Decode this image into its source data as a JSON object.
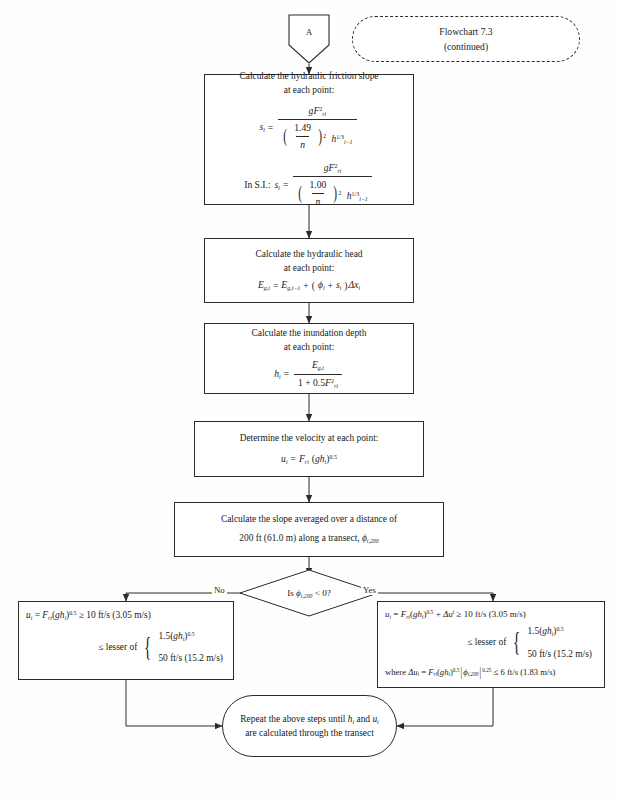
{
  "page": {
    "title_box": {
      "line1": "Flowchart 7.3",
      "line2": "(continued)"
    },
    "connector_in": {
      "label": "A",
      "icon": "pentagon-connector-icon"
    }
  },
  "nodes": {
    "friction_slope": {
      "name": "calculate-friction-slope",
      "line1": "Calculate the hydraulic friction slope",
      "line2": "at each point:",
      "eq_us": {
        "lhs": "s",
        "lhs_sub": "i",
        "eq": "=",
        "num_g": "g",
        "num_F": "F",
        "num_F_sub": "ri",
        "num_F_sup": "2",
        "den_frac_top": "1.49",
        "den_frac_bot": "n",
        "den_paren_sup": "2",
        "den_h": "h",
        "den_h_sub": "i−1",
        "den_h_sup": "1/3"
      },
      "si_prefix": "In S.I.:",
      "eq_si": {
        "lhs": "s",
        "lhs_sub": "i",
        "eq": "=",
        "num_g": "g",
        "num_F": "F",
        "num_F_sub": "ri",
        "num_F_sup": "2",
        "den_frac_top": "1.00",
        "den_frac_bot": "n",
        "den_paren_sup": "2",
        "den_h": "h",
        "den_h_sub": "i−1",
        "den_h_sup": "1/3"
      }
    },
    "hydraulic_head": {
      "name": "calculate-hydraulic-head",
      "line1": "Calculate the hydraulic head",
      "line2": "at each point:",
      "eq": {
        "lhs": "E",
        "lhs_sub": "g,i",
        "eq": "=",
        "t1": "E",
        "t1_sub": "g,i−1",
        "plus": "+",
        "open": "(",
        "phi": "ϕ",
        "phi_sub": "i",
        "plus2": "+",
        "s": "s",
        "s_sub": "i",
        "close": ")",
        "dx": "Δx",
        "dx_sub": "i"
      }
    },
    "inundation_depth": {
      "name": "calculate-inundation-depth",
      "line1": "Calculate the inundation depth",
      "line2": "at each point:",
      "eq": {
        "lhs": "h",
        "lhs_sub": "i",
        "eq": "=",
        "num": "E",
        "num_sub": "g,i",
        "den_1": "1 + 0.5",
        "den_F": "F",
        "den_F_sub": "ri",
        "den_F_sup": "2"
      }
    },
    "velocity": {
      "name": "determine-velocity",
      "line1": "Determine the velocity at each point:",
      "eq": {
        "lhs": "u",
        "lhs_sub": "i",
        "eq": "=",
        "F": "F",
        "F_sub": "ri",
        "open": "(",
        "g": "g",
        "h": "h",
        "h_sub": "i",
        "close": ")",
        "sup": "0.5"
      }
    },
    "slope_avg": {
      "name": "calculate-averaged-slope",
      "line1": "Calculate the slope averaged over a distance of",
      "line2_a": "200 ft (61.0 m) along a transect, ",
      "line2_phi": "ϕ",
      "line2_sub": "i,200"
    },
    "decision": {
      "name": "decision-slope-negative",
      "text_a": "Is ",
      "text_phi": "ϕ",
      "text_sub": "i,200",
      "text_b": " < 0?",
      "label_no": "No",
      "label_yes": "Yes"
    },
    "branch_no": {
      "name": "velocity-limits-no-branch",
      "line1": {
        "u": "u",
        "u_sub": "i",
        "eq": "=",
        "F": "F",
        "F_sub": "ri",
        "open": "(",
        "g": "g",
        "h": "h",
        "h_sub": "i",
        "close": ")",
        "sup": "0.5",
        "ge": "≥ 10 ft/s (3.05 m/s)"
      },
      "lesser_label": "≤ lesser of",
      "opt1": {
        "val": "1.5(",
        "g": "g",
        "h": "h",
        "h_sub": "i",
        "close": ")",
        "sup": "0.5"
      },
      "opt2": "50 ft/s (15.2 m/s)"
    },
    "branch_yes": {
      "name": "velocity-limits-yes-branch",
      "line1": {
        "u": "u",
        "u_sub": "i",
        "eq": "=",
        "F": "F",
        "F_sub": "ri",
        "open": "(",
        "g": "g",
        "h": "h",
        "h_sub": "i",
        "close": ")",
        "sup": "0.5",
        "plus": "+",
        "du": "Δu",
        "du_sub": "i",
        "ge": "≥ 10 ft/s (3.05 m/s)"
      },
      "lesser_label": "≤ lesser of",
      "opt1": {
        "val": "1.5(",
        "g": "g",
        "h": "h",
        "h_sub": "i",
        "close": ")",
        "sup": "0.5"
      },
      "opt2": "50 ft/s (15.2 m/s)",
      "where": {
        "prefix": "where ",
        "du": "Δu",
        "du_sub": "i",
        "eq": "=",
        "F": "F",
        "F_sub": "ri",
        "open": "(",
        "g": "g",
        "h": "h",
        "h_sub": "i",
        "close": ")",
        "sup": "0.5",
        "bar": "|",
        "phi": "ϕ",
        "phi_sub": "i,200",
        "abs_sup": "0.25",
        "le": "≤ 6 ft/s (1.83 m/s)"
      }
    },
    "terminator": {
      "name": "repeat-terminator",
      "line1_a": "Repeat the above steps until ",
      "line1_h": "h",
      "line1_h_sub": "i",
      "line1_b": " and ",
      "line1_u": "u",
      "line1_u_sub": "i",
      "line2": "are calculated through the transect"
    }
  },
  "colors": {
    "stroke": "#2b2b2b",
    "background": "#ffffff",
    "text": "#1a1a1a"
  }
}
